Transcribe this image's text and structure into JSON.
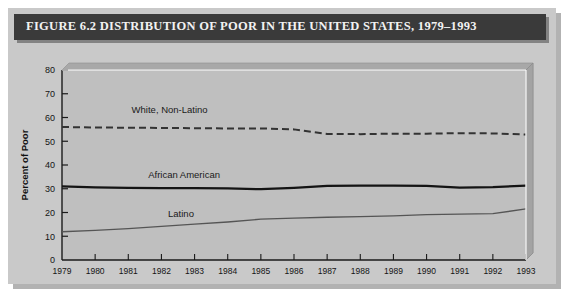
{
  "figure": {
    "title": "FIGURE 6.2  DISTRIBUTION OF POOR IN THE UNITED STATES, 1979–1993"
  },
  "colors": {
    "title_bar": "#3a3a3a",
    "title_text": "#f2f2f2",
    "plate": "#c9c9c9",
    "plot_background": "#bfbfbf",
    "axis": "#1a1a1a",
    "african_american": "#141414",
    "white_non_latino": "#333333",
    "latino": "#555555"
  },
  "chart_data": {
    "type": "line",
    "title": "DISTRIBUTION OF POOR IN THE UNITED STATES, 1979–1993",
    "xlabel": "Year",
    "ylabel": "Percent of Poor",
    "grid": false,
    "legend": "inline-labels",
    "xlim": [
      1979,
      1993
    ],
    "ylim": [
      0,
      80
    ],
    "yticks": [
      0,
      10,
      20,
      30,
      40,
      50,
      60,
      70,
      80
    ],
    "ytick_labels": [
      "0",
      "10",
      "20",
      "30",
      "40",
      "50",
      "60",
      "70",
      "80"
    ],
    "x": [
      1979,
      1980,
      1981,
      1982,
      1983,
      1984,
      1985,
      1986,
      1987,
      1988,
      1989,
      1990,
      1991,
      1992,
      1993
    ],
    "xtick_labels": [
      "1979",
      "1980",
      "1981",
      "1982",
      "1983",
      "1984",
      "1985",
      "1986",
      "1987",
      "1988",
      "1989",
      "1990",
      "1991",
      "1992",
      "1993"
    ],
    "series": [
      {
        "name": "White, Non-Latino",
        "style": "dashed",
        "label_x": 1981.1,
        "label_y": 62,
        "values": [
          56.0,
          55.8,
          55.7,
          55.6,
          55.5,
          55.4,
          55.4,
          55.0,
          53.1,
          53.0,
          53.2,
          53.2,
          53.4,
          53.3,
          52.8
        ]
      },
      {
        "name": "African American",
        "style": "solid-thick",
        "label_x": 1981.6,
        "label_y": 34.5,
        "values": [
          31.0,
          30.6,
          30.4,
          30.3,
          30.3,
          30.2,
          29.8,
          30.4,
          31.2,
          31.3,
          31.3,
          31.2,
          30.5,
          30.7,
          31.3
        ]
      },
      {
        "name": "Latino",
        "style": "solid-thin",
        "label_x": 1982.2,
        "label_y": 18.0,
        "values": [
          11.9,
          12.5,
          13.2,
          14.2,
          15.1,
          16.0,
          17.2,
          17.6,
          18.0,
          18.3,
          18.6,
          19.1,
          19.3,
          19.5,
          21.5
        ]
      }
    ]
  }
}
